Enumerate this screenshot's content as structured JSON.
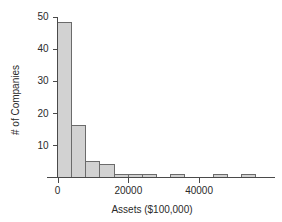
{
  "chart_data": {
    "type": "bar",
    "title": "",
    "subtitle": "",
    "xlabel": "Assets ($100,000)",
    "ylabel": "# of Companies",
    "grid": false,
    "legend": false,
    "xlim": [
      -2000,
      58000
    ],
    "ylim": [
      0,
      52
    ],
    "bin_width": 4000,
    "x_ticks": [
      0,
      20000,
      40000
    ],
    "x_tick_labels": [
      "0",
      "20000",
      "40000"
    ],
    "y_ticks": [
      10,
      20,
      30,
      40,
      50
    ],
    "y_tick_labels": [
      "10",
      "20",
      "30",
      "40",
      "50"
    ],
    "bin_starts": [
      0,
      4000,
      8000,
      12000,
      16000,
      20000,
      24000,
      28000,
      32000,
      36000,
      40000,
      44000,
      48000,
      52000
    ],
    "bin_ends": [
      4000,
      8000,
      12000,
      16000,
      20000,
      24000,
      28000,
      32000,
      36000,
      40000,
      44000,
      48000,
      52000,
      56000
    ],
    "categories": [
      "0-4000",
      "4000-8000",
      "8000-12000",
      "12000-16000",
      "16000-20000",
      "20000-24000",
      "24000-28000",
      "28000-32000",
      "32000-36000",
      "36000-40000",
      "40000-44000",
      "44000-48000",
      "48000-52000",
      "52000-56000"
    ],
    "values": [
      48,
      16,
      5,
      4,
      1,
      1,
      1,
      0,
      1,
      0,
      0,
      1,
      0,
      1
    ],
    "bar_fill_color": "#d2d2d2",
    "bar_edge_color": "#6b6b6b",
    "axis_color": "#4a4a4a"
  },
  "axes": {
    "x_title": "Assets ($100,000)",
    "y_title": "# of Companies"
  },
  "ticks": {
    "y": [
      {
        "label": "50",
        "value": 50
      },
      {
        "label": "40",
        "value": 40
      },
      {
        "label": "30",
        "value": 30
      },
      {
        "label": "20",
        "value": 20
      },
      {
        "label": "10",
        "value": 10
      }
    ],
    "x": [
      {
        "label": "0",
        "value": 0
      },
      {
        "label": "20000",
        "value": 20000
      },
      {
        "label": "40000",
        "value": 40000
      }
    ]
  }
}
